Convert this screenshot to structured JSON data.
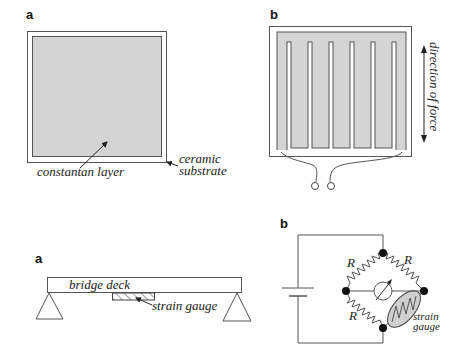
{
  "figure_top": {
    "panel_a": {
      "label": "a",
      "annotations": {
        "inner_layer": "constantan   layer",
        "substrate_line1": "ceramic",
        "substrate_line2": "substrate"
      }
    },
    "panel_b": {
      "label": "b",
      "annotations": {
        "force_direction": "direction of force"
      }
    }
  },
  "figure_bottom": {
    "panel_a": {
      "label": "a",
      "annotations": {
        "deck": "bridge   deck",
        "gauge": "strain   gauge"
      }
    },
    "panel_b": {
      "label": "b",
      "annotations": {
        "resistor_top_left": "R",
        "resistor_top_right": "R",
        "resistor_bottom_left": "R",
        "gauge_line1": "strain",
        "gauge_line2": "gauge"
      }
    }
  },
  "colors": {
    "layer_fill": "#d4d4d4",
    "stroke": "#555555",
    "node": "#111111"
  }
}
